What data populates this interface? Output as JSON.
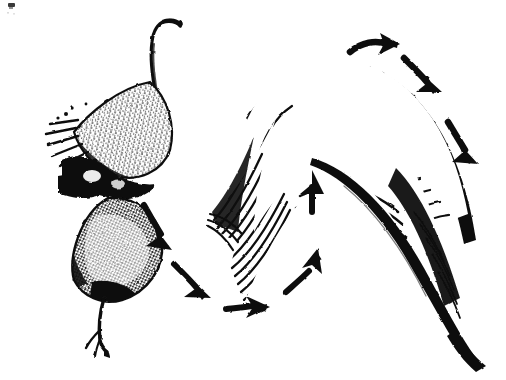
{
  "figure": {
    "kind": "engraving-illustration",
    "caption": "",
    "background_color": "#ffffff",
    "ink_color": "#111111",
    "width": 506,
    "height": 380,
    "alt_text": "Black and white engraving of a seed pod at left and a large curved feather at right, with a ring of arrows showing a circular flow between them."
  },
  "objects": [
    {
      "id": "seed-pod",
      "label": "seed-pod",
      "description": "Stippled seed or pod body with a slender curved stalk rising from the top and a forked stem trailing below.",
      "bbox": [
        58,
        18,
        180,
        348
      ]
    },
    {
      "id": "feather",
      "label": "feather",
      "description": "Large curved feather with dense hatched barbs and a tapering rachis running to the lower right.",
      "bbox": [
        207,
        55,
        496,
        360
      ]
    }
  ],
  "arrows": [
    {
      "id": "arrow-1",
      "label": "arrow-top-right-curve",
      "direction": "right",
      "note": "curving right over the feather tip"
    },
    {
      "id": "arrow-2",
      "label": "arrow-upper-right-descend",
      "direction": "down-right",
      "note": "descending along the feather's outer edge"
    },
    {
      "id": "arrow-3",
      "label": "arrow-right-descend",
      "direction": "down-right",
      "note": "continuing down the right side"
    },
    {
      "id": "arrow-4",
      "label": "arrow-left-descend",
      "direction": "down-right",
      "note": "leaving the seed pod downward"
    },
    {
      "id": "arrow-5",
      "label": "arrow-lower-left-descend",
      "direction": "down-right",
      "note": "second step along the lower path"
    },
    {
      "id": "arrow-6",
      "label": "arrow-bottom-right",
      "direction": "right",
      "note": "short horizontal arrow at the bottom"
    },
    {
      "id": "arrow-7",
      "label": "arrow-bottom-rise",
      "direction": "up-right",
      "note": "rising toward the feather"
    },
    {
      "id": "arrow-8",
      "label": "arrow-center-up",
      "direction": "up",
      "note": "vertical arrow beneath the feather arch"
    }
  ],
  "marks": [
    {
      "id": "corner-mark",
      "label": "corner-speck",
      "note": "small ink speck at the upper-left corner of the plate"
    }
  ]
}
